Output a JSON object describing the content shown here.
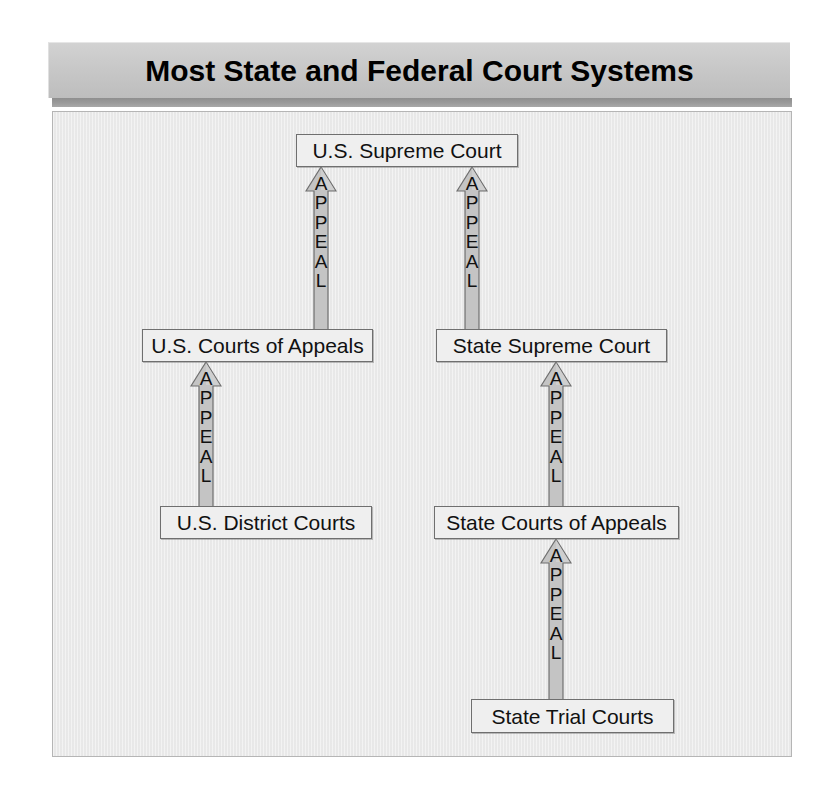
{
  "title": {
    "text": "Most State and Federal Court Systems"
  },
  "colors": {
    "title_bar_bg": "#c8c8c8",
    "title_underbar": "#9a9a9a",
    "panel_bg": "#ebebeb",
    "panel_border": "#b5b5b5",
    "box_fill": "#efefef",
    "box_border": "#6f6f6f",
    "arrow_fill": "#c4c4c4",
    "arrow_border": "#6f6f6f",
    "text": "#111111"
  },
  "diagram": {
    "type": "flowchart",
    "orientation": "bottom-up",
    "nodes": [
      {
        "id": "us-supreme",
        "label": "U.S. Supreme Court",
        "tier": "top",
        "system": "federal-and-state"
      },
      {
        "id": "us-appeals",
        "label": "U.S. Courts of Appeals",
        "tier": "middle",
        "system": "federal"
      },
      {
        "id": "state-supreme",
        "label": "State Supreme Court",
        "tier": "middle",
        "system": "state"
      },
      {
        "id": "us-district",
        "label": "U.S. District Courts",
        "tier": "lower",
        "system": "federal"
      },
      {
        "id": "state-appeals",
        "label": "State Courts of Appeals",
        "tier": "lower",
        "system": "state"
      },
      {
        "id": "state-trial",
        "label": "State Trial Courts",
        "tier": "bottom",
        "system": "state"
      }
    ],
    "edges": [
      {
        "id": "edge-1",
        "from": "us-appeals",
        "to": "us-supreme",
        "label": "APPEAL"
      },
      {
        "id": "edge-2",
        "from": "state-supreme",
        "to": "us-supreme",
        "label": "APPEAL"
      },
      {
        "id": "edge-3",
        "from": "us-district",
        "to": "us-appeals",
        "label": "APPEAL"
      },
      {
        "id": "edge-4",
        "from": "state-appeals",
        "to": "state-supreme",
        "label": "APPEAL"
      },
      {
        "id": "edge-5",
        "from": "state-trial",
        "to": "state-appeals",
        "label": "APPEAL"
      }
    ],
    "edge_label_letters": [
      "A",
      "P",
      "P",
      "E",
      "A",
      "L"
    ]
  }
}
